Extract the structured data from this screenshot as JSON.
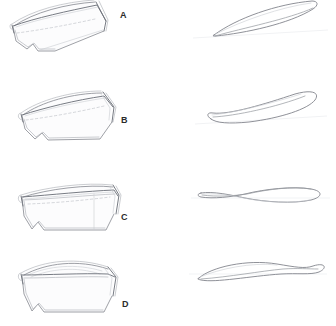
{
  "figure": {
    "background_color": "#ffffff",
    "stroke_color": "#8c8f96",
    "label_color": "#2b2b2b",
    "rows": [
      {
        "id": "a",
        "label": "A",
        "left_view_name": "hull-perspective-view",
        "right_view_name": "hull-plan-outline",
        "left_description": "Three-quarter perspective pencil sketch of an open boat hull, bow at right, sheer line sweeping up, dashed waterline across the interior",
        "right_description": "Narrow pointed leaf-shaped plan outline of the hull, tilted upward to the right"
      },
      {
        "id": "b",
        "label": "B",
        "left_view_name": "hull-perspective-view",
        "right_view_name": "hull-plan-outline",
        "left_description": "Three-quarter perspective pencil sketch of a wide-beam open boat hull with flat sheer, bow at right",
        "right_description": "Tilted elongated teardrop plan outline with a pinched tail at the lower left"
      },
      {
        "id": "c",
        "label": "C",
        "left_view_name": "hull-perspective-view",
        "right_view_name": "hull-plan-outline",
        "left_description": "Near profile pencil sketch of a shallow open boat hull with long straight gunwale, bow at right",
        "right_description": "Horizontal bow-tie / figure-eight plan outline, crossing near the left third"
      },
      {
        "id": "d",
        "label": "D",
        "left_view_name": "hull-perspective-view",
        "right_view_name": "hull-plan-outline",
        "left_description": "Three-quarter perspective pencil sketch of a rounded dinghy hull with visible interior, bow at right",
        "right_description": "Horizontal elongated plan outline with a small loop pinched off at the right end"
      }
    ]
  }
}
